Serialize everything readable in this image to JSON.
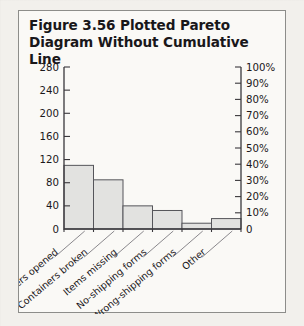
{
  "figure": {
    "number_label": "Figure 3.56",
    "caption_text": "Plotted Pareto Diagram Without Cumulative Line"
  },
  "chart_data": {
    "type": "bar",
    "title": "Plotted Pareto Diagram Without Cumulative Line",
    "xlabel": "",
    "ylabel": "",
    "categories": [
      "Containers opened",
      "Containers broken",
      "Items missing",
      "No-shipping forms",
      "Wrong-shipping forms",
      "Other"
    ],
    "values": [
      110,
      85,
      40,
      32,
      10,
      18
    ],
    "ylim": [
      0,
      280
    ],
    "yticks": [
      0,
      40,
      80,
      120,
      160,
      200,
      240,
      280
    ],
    "ytick_labels": [
      "0",
      "40",
      "80",
      "120",
      "160",
      "200",
      "240",
      "280"
    ],
    "y2lim": [
      0,
      100
    ],
    "y2ticks": [
      0,
      10,
      20,
      30,
      40,
      50,
      60,
      70,
      80,
      90,
      100
    ],
    "y2tick_labels": [
      "0",
      "10%",
      "20%",
      "30%",
      "40%",
      "50%",
      "60%",
      "70%",
      "80%",
      "90%",
      "100%"
    ],
    "grid": false,
    "legend": "none",
    "bar_fill": "#e2e2e0",
    "bar_stroke": "#55555a"
  }
}
